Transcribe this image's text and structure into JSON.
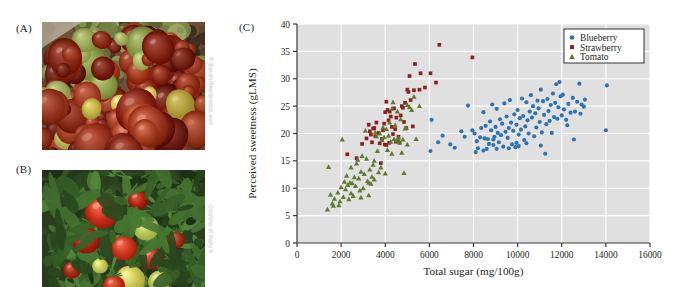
{
  "figure": {
    "panels": [
      {
        "id": "A",
        "label": "(A)",
        "caption_credit": "© Bianchi/Shutterstock.com",
        "subject": "pile of red and green heirloom tomatoes"
      },
      {
        "id": "B",
        "label": "(B)",
        "caption_credit": "Courtesy of Harry K",
        "subject": "ripening tomatoes on the vine with green leaves"
      },
      {
        "id": "C",
        "label": "(C)",
        "subject": "scatter plot of perceived sweetness versus total sugar"
      }
    ]
  },
  "colors": {
    "blueberry": "#2e72b0",
    "strawberry": "#8b2220",
    "tomato": "#5d7a2f",
    "plot_background": "#e0e0e0",
    "gridline": "#ffffff",
    "axis": "#3a3a3a",
    "page_background": "#ffffff"
  },
  "chart_data": {
    "type": "scatter",
    "title": "",
    "xlabel": "Total sugar (mg/100g)",
    "ylabel": "Perceived sweetness (gLMS)",
    "xlim": [
      0,
      16000
    ],
    "ylim": [
      0,
      40
    ],
    "xticks": [
      0,
      2000,
      4000,
      6000,
      8000,
      10000,
      12000,
      14000,
      16000
    ],
    "yticks": [
      0,
      5,
      10,
      15,
      20,
      25,
      30,
      35,
      40
    ],
    "xticklabels": [
      "0",
      "2000",
      "4000",
      "6000",
      "8000",
      "10000",
      "12000",
      "14000",
      "16000"
    ],
    "yticklabels": [
      "0",
      "5",
      "10",
      "15",
      "20",
      "25",
      "30",
      "35",
      "40"
    ],
    "grid": true,
    "grid_axes": "both",
    "legend_position": "top-right",
    "legend": [
      "Blueberry",
      "Strawberry",
      "Tomato"
    ],
    "series": [
      {
        "name": "Blueberry",
        "color": "#2e72b0",
        "marker": "circle",
        "points": [
          [
            6050,
            16.8
          ],
          [
            6100,
            22.5
          ],
          [
            6400,
            18.4
          ],
          [
            6600,
            19.6
          ],
          [
            6950,
            18.0
          ],
          [
            7150,
            17.4
          ],
          [
            7450,
            20.4
          ],
          [
            7600,
            19.4
          ],
          [
            7750,
            25.1
          ],
          [
            7950,
            20.6
          ],
          [
            8050,
            20.0
          ],
          [
            8100,
            16.6
          ],
          [
            8150,
            18.6
          ],
          [
            8200,
            17.3
          ],
          [
            8300,
            19.3
          ],
          [
            8350,
            21.0
          ],
          [
            8450,
            23.9
          ],
          [
            8500,
            19.1
          ],
          [
            8550,
            21.4
          ],
          [
            8600,
            17.2
          ],
          [
            8650,
            19.0
          ],
          [
            8700,
            18.1
          ],
          [
            8750,
            22.2
          ],
          [
            8800,
            20.6
          ],
          [
            8850,
            25.3
          ],
          [
            8900,
            18.9
          ],
          [
            8950,
            19.4
          ],
          [
            9000,
            21.2
          ],
          [
            9050,
            24.5
          ],
          [
            9100,
            20.1
          ],
          [
            9150,
            18.4
          ],
          [
            9200,
            22.6
          ],
          [
            9250,
            19.7
          ],
          [
            9300,
            21.8
          ],
          [
            9350,
            17.6
          ],
          [
            9400,
            25.5
          ],
          [
            9450,
            20.3
          ],
          [
            9500,
            23.1
          ],
          [
            9550,
            19.2
          ],
          [
            9600,
            21.0
          ],
          [
            9650,
            26.1
          ],
          [
            9700,
            22.0
          ],
          [
            9750,
            18.0
          ],
          [
            9800,
            20.5
          ],
          [
            9850,
            23.5
          ],
          [
            9900,
            17.5
          ],
          [
            9950,
            21.6
          ],
          [
            10000,
            24.3
          ],
          [
            10050,
            19.8
          ],
          [
            10100,
            22.8
          ],
          [
            10150,
            20.7
          ],
          [
            10200,
            26.4
          ],
          [
            10250,
            23.2
          ],
          [
            10300,
            18.8
          ],
          [
            10350,
            21.3
          ],
          [
            10400,
            25.7
          ],
          [
            10450,
            22.4
          ],
          [
            10500,
            20.0
          ],
          [
            10550,
            24.0
          ],
          [
            10600,
            27.0
          ],
          [
            10650,
            22.9
          ],
          [
            10700,
            25.0
          ],
          [
            10750,
            19.5
          ],
          [
            10800,
            23.7
          ],
          [
            10850,
            21.1
          ],
          [
            10900,
            26.0
          ],
          [
            10950,
            24.6
          ],
          [
            11000,
            22.1
          ],
          [
            11050,
            28.0
          ],
          [
            11100,
            20.2
          ],
          [
            11150,
            25.9
          ],
          [
            11200,
            23.4
          ],
          [
            11250,
            16.3
          ],
          [
            11300,
            21.7
          ],
          [
            11350,
            26.3
          ],
          [
            11400,
            24.1
          ],
          [
            11450,
            22.3
          ],
          [
            11500,
            25.2
          ],
          [
            11550,
            20.1
          ],
          [
            11600,
            27.3
          ],
          [
            11650,
            23.0
          ],
          [
            11700,
            25.6
          ],
          [
            11750,
            29.0
          ],
          [
            11800,
            22.7
          ],
          [
            11850,
            24.8
          ],
          [
            11900,
            29.4
          ],
          [
            11950,
            26.8
          ],
          [
            12000,
            23.3
          ],
          [
            12050,
            27.1
          ],
          [
            12100,
            24.4
          ],
          [
            12200,
            22.5
          ],
          [
            12300,
            25.4
          ],
          [
            12400,
            23.8
          ],
          [
            12500,
            26.5
          ],
          [
            12600,
            24.0
          ],
          [
            12700,
            25.8
          ],
          [
            12800,
            29.1
          ],
          [
            12850,
            23.6
          ],
          [
            12900,
            25.3
          ],
          [
            13000,
            24.9
          ],
          [
            12250,
            21.5
          ],
          [
            11050,
            17.8
          ],
          [
            10050,
            17.7
          ],
          [
            9050,
            17.2
          ],
          [
            8450,
            16.9
          ],
          [
            14050,
            28.8
          ],
          [
            14000,
            20.6
          ],
          [
            13050,
            26.2
          ],
          [
            12550,
            18.9
          ],
          [
            9950,
            18.3
          ],
          [
            10400,
            18.2
          ],
          [
            8900,
            17.9
          ],
          [
            9600,
            17.3
          ]
        ]
      },
      {
        "name": "Strawberry",
        "color": "#8b2220",
        "marker": "square",
        "points": [
          [
            2280,
            16.2
          ],
          [
            2700,
            15.5
          ],
          [
            2950,
            18.1
          ],
          [
            3150,
            19.1
          ],
          [
            3250,
            21.6
          ],
          [
            3300,
            20.4
          ],
          [
            3350,
            19.8
          ],
          [
            3400,
            18.4
          ],
          [
            3450,
            20.9
          ],
          [
            3500,
            21.0
          ],
          [
            3550,
            19.5
          ],
          [
            3600,
            22.0
          ],
          [
            3700,
            20.1
          ],
          [
            3750,
            18.2
          ],
          [
            3800,
            14.6
          ],
          [
            3850,
            19.0
          ],
          [
            3900,
            20.6
          ],
          [
            3950,
            21.8
          ],
          [
            4000,
            23.9
          ],
          [
            4050,
            25.8
          ],
          [
            4100,
            24.3
          ],
          [
            4150,
            22.4
          ],
          [
            4200,
            24.0
          ],
          [
            4250,
            23.1
          ],
          [
            4300,
            21.2
          ],
          [
            4350,
            19.9
          ],
          [
            4400,
            24.6
          ],
          [
            4450,
            20.8
          ],
          [
            4500,
            22.9
          ],
          [
            4550,
            18.6
          ],
          [
            4600,
            19.4
          ],
          [
            4650,
            18.3
          ],
          [
            4700,
            23.3
          ],
          [
            4750,
            25.0
          ],
          [
            4800,
            24.7
          ],
          [
            4850,
            22.1
          ],
          [
            4900,
            25.6
          ],
          [
            4950,
            21.0
          ],
          [
            5000,
            28.0
          ],
          [
            5050,
            27.6
          ],
          [
            5100,
            30.5
          ],
          [
            5150,
            26.1
          ],
          [
            5250,
            21.3
          ],
          [
            5300,
            27.9
          ],
          [
            5350,
            32.7
          ],
          [
            5550,
            28.0
          ],
          [
            5600,
            31.0
          ],
          [
            5800,
            28.4
          ],
          [
            6050,
            31.0
          ],
          [
            6300,
            29.3
          ],
          [
            6450,
            36.2
          ],
          [
            7950,
            33.9
          ],
          [
            4480,
            18.5
          ],
          [
            4180,
            18.3
          ],
          [
            3980,
            18.0
          ],
          [
            4050,
            17.9
          ]
        ]
      },
      {
        "name": "Tomato",
        "color": "#5d7a2f",
        "marker": "triangle",
        "points": [
          [
            1380,
            6.1
          ],
          [
            1430,
            13.9
          ],
          [
            1520,
            8.8
          ],
          [
            1600,
            7.2
          ],
          [
            1650,
            6.8
          ],
          [
            1700,
            8.1
          ],
          [
            1850,
            9.2
          ],
          [
            1900,
            6.9
          ],
          [
            1950,
            7.6
          ],
          [
            2000,
            10.2
          ],
          [
            2050,
            18.9
          ],
          [
            2100,
            8.4
          ],
          [
            2150,
            11.2
          ],
          [
            2200,
            9.8
          ],
          [
            2250,
            12.3
          ],
          [
            2300,
            10.6
          ],
          [
            2350,
            8.0
          ],
          [
            2400,
            11.0
          ],
          [
            2450,
            9.1
          ],
          [
            2500,
            10.9
          ],
          [
            2550,
            8.6
          ],
          [
            2600,
            12.0
          ],
          [
            2650,
            10.4
          ],
          [
            2700,
            14.5
          ],
          [
            2750,
            15.2
          ],
          [
            2800,
            11.8
          ],
          [
            2850,
            9.6
          ],
          [
            2900,
            13.0
          ],
          [
            2950,
            15.9
          ],
          [
            3000,
            10.0
          ],
          [
            3050,
            12.6
          ],
          [
            3100,
            20.5
          ],
          [
            3150,
            15.4
          ],
          [
            3200,
            11.3
          ],
          [
            3250,
            8.7
          ],
          [
            3300,
            13.4
          ],
          [
            3350,
            10.8
          ],
          [
            3400,
            12.1
          ],
          [
            3450,
            14.3
          ],
          [
            3500,
            11.6
          ],
          [
            3550,
            20.2
          ],
          [
            3600,
            19.5
          ],
          [
            3650,
            16.8
          ],
          [
            3700,
            12.9
          ],
          [
            3750,
            20.0
          ],
          [
            3800,
            13.8
          ],
          [
            3850,
            18.8
          ],
          [
            3900,
            21.1
          ],
          [
            3950,
            19.3
          ],
          [
            4000,
            12.7
          ],
          [
            4050,
            20.8
          ],
          [
            4100,
            17.0
          ],
          [
            4150,
            19.6
          ],
          [
            4200,
            22.0
          ],
          [
            4250,
            18.5
          ],
          [
            4300,
            16.3
          ],
          [
            4350,
            25.7
          ],
          [
            4400,
            19.0
          ],
          [
            4450,
            21.5
          ],
          [
            4500,
            18.7
          ],
          [
            4550,
            24.0
          ],
          [
            4600,
            19.2
          ],
          [
            4650,
            18.4
          ],
          [
            4700,
            22.6
          ],
          [
            4750,
            16.5
          ],
          [
            4800,
            18.9
          ],
          [
            4850,
            12.8
          ],
          [
            4900,
            20.9
          ],
          [
            4950,
            21.0
          ],
          [
            5000,
            25.2
          ],
          [
            5100,
            24.8
          ],
          [
            5200,
            24.3
          ],
          [
            5300,
            26.7
          ],
          [
            5550,
            25.0
          ],
          [
            5400,
            19.0
          ],
          [
            5000,
            18.0
          ],
          [
            4300,
            24.5
          ],
          [
            3500,
            15.0
          ],
          [
            3250,
            11.0
          ],
          [
            2450,
            13.8
          ],
          [
            2900,
            8.3
          ]
        ]
      }
    ]
  }
}
